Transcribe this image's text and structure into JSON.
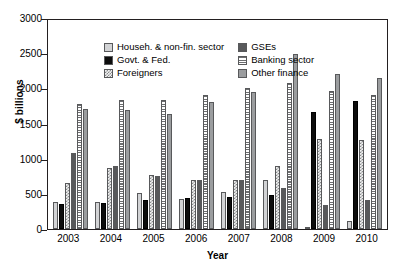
{
  "chart_data": {
    "type": "bar",
    "title": "",
    "xlabel": "Year",
    "ylabel": "$ billions",
    "categories": [
      "2003",
      "2004",
      "2005",
      "2006",
      "2007",
      "2008",
      "2009",
      "2010"
    ],
    "ylim": [
      0,
      3000
    ],
    "yticks": [
      "3000",
      "2500",
      "2000",
      "1500",
      "1000",
      "500",
      "0"
    ],
    "grid": false,
    "legend_position": "top-left inside plot",
    "series": [
      {
        "name": "Househ. & non-fin. sector",
        "values": [
          380,
          390,
          510,
          430,
          530,
          700,
          30,
          110
        ]
      },
      {
        "name": "Govt. & Fed.",
        "values": [
          350,
          370,
          410,
          440,
          450,
          490,
          1660,
          1820
        ]
      },
      {
        "name": "Foreigners",
        "values": [
          650,
          870,
          770,
          700,
          700,
          900,
          1280,
          1260
        ]
      },
      {
        "name": "GSEs",
        "values": [
          1080,
          900,
          760,
          700,
          690,
          580,
          340,
          410
        ]
      },
      {
        "name": "Banking sector",
        "values": [
          1780,
          1840,
          1840,
          1900,
          2000,
          2080,
          1960,
          1900
        ]
      },
      {
        "name": "Other finance",
        "values": [
          1700,
          1690,
          1640,
          1800,
          1950,
          2490,
          2200,
          2150
        ]
      }
    ]
  },
  "legend": {
    "column1": [
      "Househ. & non-fin. sector",
      "Govt. & Fed.",
      "Foreigners"
    ],
    "column2": [
      "GSEs",
      "Banking sector",
      "Other finance"
    ]
  },
  "colors": {
    "household": "#d2d3d5",
    "government": "#0d0d0d",
    "foreigners": "#8a8c8e",
    "gses": "#58595b",
    "banking": "#6d6e70",
    "other_finance": "#9b9d9f",
    "axis": "#231f20"
  }
}
